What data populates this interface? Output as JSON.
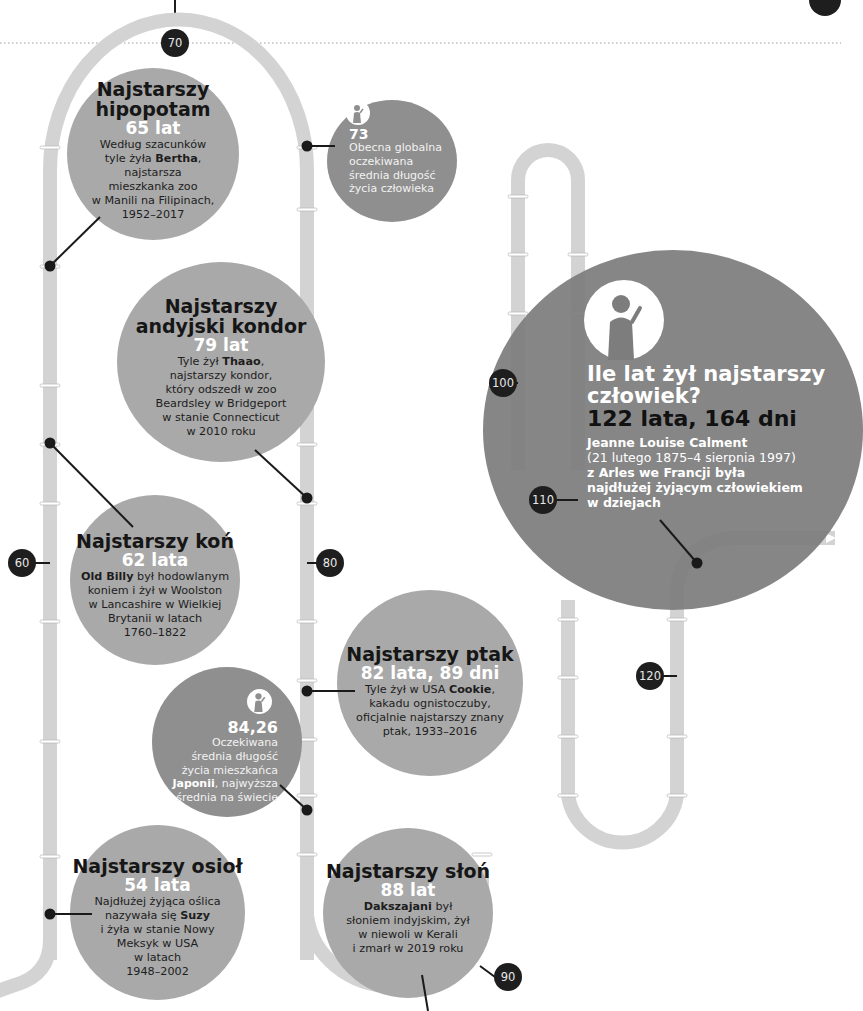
{
  "timeline": {
    "markers": [
      "60",
      "70",
      "80",
      "90",
      "100",
      "110",
      "120"
    ]
  },
  "facts": {
    "hippo": {
      "title_line1": "Najstarszy",
      "title_line2": "hipopotam",
      "age": "65 lat",
      "desc_lines": [
        "Według szacunków",
        "tyle żyła ",
        "Bertha",
        ",",
        "najstarsza",
        "mieszkanka zoo",
        "w Manili na Filipinach,",
        "1952–2017"
      ]
    },
    "global_life": {
      "icon": "person-icon",
      "value": "73",
      "desc_lines": [
        "Obecna globalna",
        "oczekiwana",
        "średnia długość",
        "życia człowieka"
      ]
    },
    "condor": {
      "title_line1": "Najstarszy",
      "title_line2": "andyjski kondor",
      "age": "79 lat",
      "desc_pre": "Tyle żył ",
      "desc_name": "Thaao",
      "desc_post": ",",
      "desc_lines": [
        "najstarszy kondor,",
        "który odszedł w zoo",
        "Beardsley w Bridgeport",
        "w stanie Connecticut",
        "w 2010 roku"
      ]
    },
    "horse": {
      "title": "Najstarszy koń",
      "age": "62 lata",
      "desc_name": "Old Billy",
      "desc_post": " był hodowlanym",
      "desc_lines": [
        "koniem i żył w Woolston",
        "w Lancashire w Wielkiej",
        "Brytanii w latach",
        "1760–1822"
      ]
    },
    "bird": {
      "title": "Najstarszy ptak",
      "age": "82 lata, 89 dni",
      "desc_pre": "Tyle żył w USA ",
      "desc_name": "Cookie",
      "desc_post": ",",
      "desc_lines": [
        "kakadu ognistoczuby,",
        "oficjalnie najstarszy znany",
        "ptak, 1933–2016"
      ]
    },
    "japan": {
      "icon": "person-icon",
      "value": "84,26",
      "desc_lines": [
        "Oczekiwana",
        "średnia długość",
        "życia mieszkańca"
      ],
      "desc_name": "Japonii",
      "desc_post": ", najwyższa",
      "desc_last": "średnia na świecie"
    },
    "donkey": {
      "title": "Najstarszy osioł",
      "age": "54 lata",
      "desc_line1": "Najdłużej żyjąca oślica",
      "desc_pre": "nazywała się ",
      "desc_name": "Suzy",
      "desc_lines": [
        "i żyła w stanie Nowy",
        "Meksyk w USA",
        "w latach",
        "1948–2002"
      ]
    },
    "elephant": {
      "title": "Najstarszy słoń",
      "age": "88 lat",
      "desc_name": "Dakszajani",
      "desc_post": " był",
      "desc_lines": [
        "słoniem indyjskim, żył",
        "w niewoli w Kerali",
        "i zmarł w 2019 roku"
      ]
    },
    "human": {
      "icon": "person-icon",
      "question_line1": "Ile lat żył najstarszy",
      "question_line2": "człowiek?",
      "age": "122 lata, 164 dni",
      "name": "Jeanne Louise Calment",
      "desc_lines": [
        "(21 lutego 1875–4 sierpnia 1997)",
        "z Arles we Francji była",
        "najdłużej żyjącym człowiekiem",
        "w dziejach"
      ]
    }
  },
  "colors": {
    "pipe": "#d2d2d2",
    "bubble": "#a9a9a9",
    "bubble_dark": "#8f8f8f",
    "bubble_big": "#7d7d7d",
    "marker": "#1e1e1e"
  }
}
